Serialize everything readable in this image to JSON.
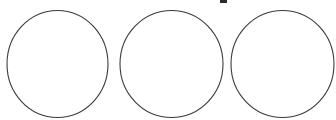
{
  "canvas": {
    "width": 336,
    "height": 120,
    "background_color": "#ffffff",
    "title": "three-circles-outline"
  },
  "style": {
    "stroke_color": "#3a3a3a",
    "stroke_width": 1.1,
    "fill_color": "none",
    "mark_color": "#2b2b2b"
  },
  "shapes": [
    {
      "name": "circle-left",
      "label": "Circle 1",
      "cx": 57.5,
      "cy": 64,
      "rx": 50.5,
      "ry": 53.5
    },
    {
      "name": "circle-middle",
      "label": "Circle 2",
      "cx": 171.5,
      "cy": 64,
      "rx": 51.5,
      "ry": 53.5
    },
    {
      "name": "circle-right",
      "label": "Circle 3",
      "cx": 282.5,
      "cy": 64,
      "rx": 51.5,
      "ry": 53.5
    }
  ],
  "artifacts": [
    {
      "name": "clipped-top-mark",
      "label": "clipped glyph fragment",
      "x": 220,
      "y": 0,
      "width": 7,
      "height": 3
    }
  ]
}
